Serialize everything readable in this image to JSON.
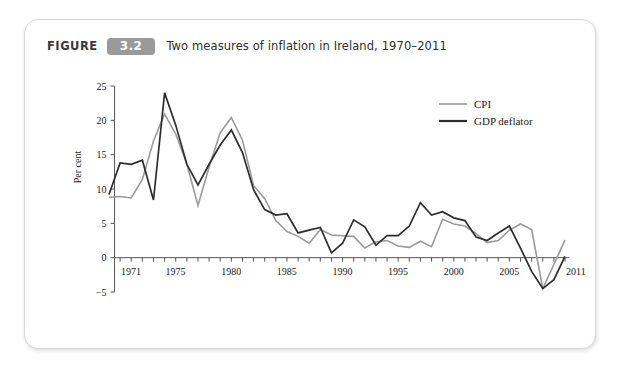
{
  "figure": {
    "label_word": "FIGURE",
    "number": "3.2",
    "title": "Two measures of inflation in Ireland, 1970–2011",
    "badge_color": "#9a9a9a",
    "card_background": "#ffffff",
    "page_background": "#ffffff"
  },
  "chart_data": {
    "type": "line",
    "title": "Two measures of inflation in Ireland, 1970–2011",
    "xlabel": "",
    "ylabel": "Per cent",
    "xlim": [
      1970,
      2011
    ],
    "ylim": [
      -5,
      25
    ],
    "ytick_labels": [
      "25",
      "20",
      "15",
      "10",
      "5",
      "0",
      "−5"
    ],
    "yticks": [
      25,
      20,
      15,
      10,
      5,
      0,
      -5
    ],
    "xtick_labels": [
      "1971",
      "1975",
      "1980",
      "1985",
      "1990",
      "1995",
      "2000",
      "2005",
      "2011"
    ],
    "xticks": [
      1971,
      1975,
      1980,
      1985,
      1990,
      1995,
      2000,
      2005,
      2011
    ],
    "minor_xticks_every": 1,
    "grid": false,
    "legend_position": "top-right",
    "x": [
      1970,
      1971,
      1972,
      1973,
      1974,
      1975,
      1976,
      1977,
      1978,
      1979,
      1980,
      1981,
      1982,
      1983,
      1984,
      1985,
      1986,
      1987,
      1988,
      1989,
      1990,
      1991,
      1992,
      1993,
      1994,
      1995,
      1996,
      1997,
      1998,
      1999,
      2000,
      2001,
      2002,
      2003,
      2004,
      2005,
      2006,
      2007,
      2008,
      2009,
      2010,
      2011
    ],
    "series": [
      {
        "name": "CPI",
        "color": "#9b9b9b",
        "width": 1.6,
        "values": [
          8.8,
          8.9,
          8.7,
          11.4,
          17.0,
          20.9,
          18.0,
          13.6,
          7.6,
          13.2,
          18.2,
          20.4,
          17.1,
          10.5,
          8.6,
          5.4,
          3.8,
          3.1,
          2.1,
          4.1,
          3.3,
          3.2,
          3.1,
          1.4,
          2.3,
          2.5,
          1.7,
          1.5,
          2.4,
          1.6,
          5.6,
          4.9,
          4.6,
          3.5,
          2.2,
          2.5,
          4.0,
          4.9,
          4.1,
          -4.5,
          -1.0,
          2.6
        ]
      },
      {
        "name": "GDP deflator",
        "color": "#2e2e2e",
        "width": 1.7,
        "values": [
          9.2,
          13.8,
          13.6,
          14.2,
          8.4,
          24.0,
          19.3,
          13.6,
          10.6,
          13.6,
          16.4,
          18.6,
          15.3,
          9.9,
          7.0,
          6.2,
          6.4,
          3.6,
          4.0,
          4.4,
          0.7,
          2.1,
          5.5,
          4.5,
          1.8,
          3.2,
          3.2,
          4.6,
          8.0,
          6.2,
          6.7,
          5.8,
          5.4,
          3.0,
          2.5,
          3.6,
          4.6,
          1.4,
          -2.0,
          -4.5,
          -3.2,
          0.2
        ]
      }
    ]
  },
  "legend": {
    "items": [
      {
        "label": "CPI",
        "color": "#9b9b9b"
      },
      {
        "label": "GDP deflator",
        "color": "#2e2e2e"
      }
    ]
  }
}
